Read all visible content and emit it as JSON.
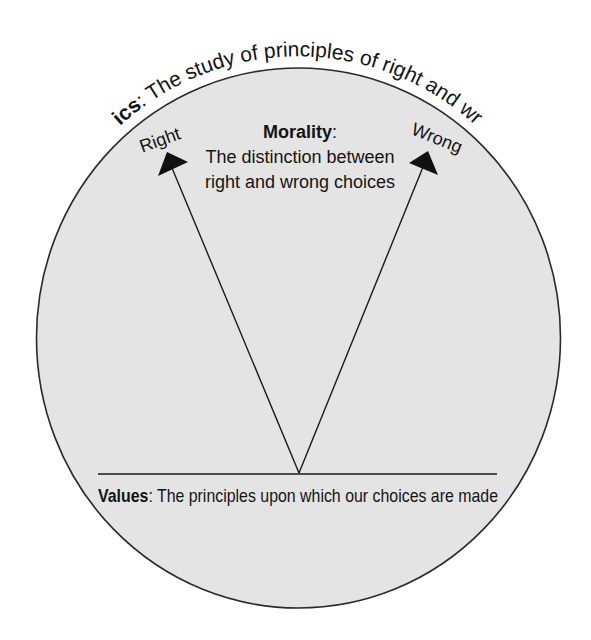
{
  "diagram": {
    "title": {
      "bold": "Ethics",
      "rest": ": The study of principles of right and wrong"
    },
    "morality": {
      "heading": "Morality",
      "colon": ":",
      "line1": "The distinction between",
      "line2": "right and wrong choices"
    },
    "arrows": {
      "left_label": "Right",
      "right_label": "Wrong"
    },
    "values": {
      "bold": "Values",
      "rest": ": The principles upon which our choices are made"
    },
    "colors": {
      "circle_fill": "#e4e4e4",
      "stroke": "#2a2a2a",
      "text": "#141414"
    }
  }
}
